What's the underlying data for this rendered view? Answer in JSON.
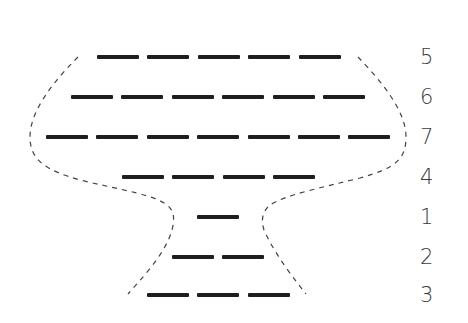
{
  "diagram": {
    "type": "goblet-shaped dashed-line puzzle",
    "dash_color": "#1e1e1e",
    "outline_color": "#444444",
    "rows": [
      {
        "label": "5",
        "dashes": 5,
        "y": 57,
        "x_start": 97
      },
      {
        "label": "6",
        "dashes": 6,
        "y": 97,
        "x_start": 71
      },
      {
        "label": "7",
        "dashes": 7,
        "y": 137,
        "x_start": 46
      },
      {
        "label": "4",
        "dashes": 4,
        "y": 177,
        "x_start": 122
      },
      {
        "label": "1",
        "dashes": 1,
        "y": 217,
        "x_start": 197
      },
      {
        "label": "2",
        "dashes": 2,
        "y": 257,
        "x_start": 172
      },
      {
        "label": "3",
        "dashes": 3,
        "y": 295,
        "x_start": 147
      }
    ],
    "dash_length": 42,
    "dash_pitch": 50.4
  }
}
